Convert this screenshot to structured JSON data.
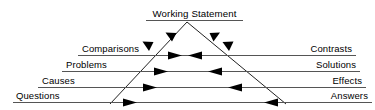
{
  "diagram": {
    "type": "triangle-rhetoric-diagram",
    "background_color": "#ffffff",
    "line_color": "#555555",
    "triangle_color": "#222222",
    "text_color": "#000000",
    "apex": {
      "label": "Working Statement",
      "underline": true
    },
    "levels": [
      {
        "index": 0,
        "left_label": "Comparisons",
        "right_label": "Contrasts",
        "arrow_direction": "inward-both",
        "arrow_count": 2
      },
      {
        "index": 1,
        "left_label": "Problems",
        "right_label": "Solutions",
        "arrow_direction": "inward-both",
        "arrow_count": 2
      },
      {
        "index": 2,
        "left_label": "Causes",
        "right_label": "Effects",
        "arrow_direction": "inward-both",
        "arrow_count": 2
      },
      {
        "index": 3,
        "left_label": "Questions",
        "right_label": "Answers",
        "arrow_direction": "inward-both",
        "arrow_count": 2
      }
    ],
    "triangle_side_arrows": {
      "left_side_direction": "down-left",
      "right_side_direction": "down-right",
      "count_per_side": 2
    }
  }
}
